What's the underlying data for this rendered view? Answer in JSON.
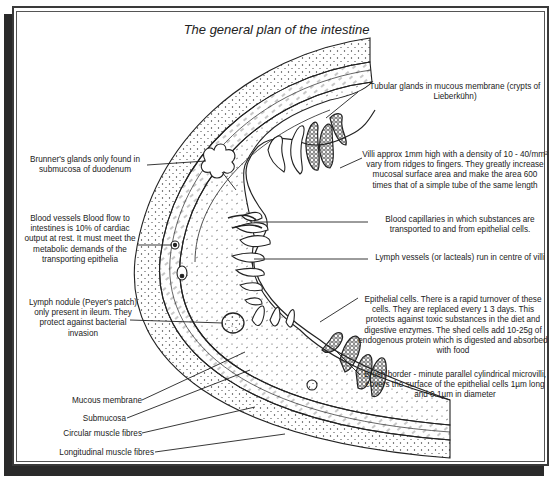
{
  "title": "The general plan of the intestine",
  "labels": {
    "tubular_glands": "Tubular glands in mucous membrane (crypts of Lieberkühn)",
    "villi": "Villi  approx 1mm high with a density of 10 - 40/mm² vary from ridges to fingers. They greatly increase mucosal surface area and make the area 600 times that of a simple tube of the same length",
    "brunners_glands": "Brunner's glands only found in submucosa of duodenum",
    "blood_vessels": "Blood vessels Blood flow to intestines is 10% of cardiac output at rest. It must meet the metabolic demands of the transporting epithelia",
    "blood_capillaries": "Blood capillaries in which substances are transported to and from epithelial cells.",
    "lymph_vessels": "Lymph vessels (or lacteals) run in centre of villi",
    "lymph_nodule": "Lymph nodule (Peyer's patch) only present in ileum. They protect against bacterial invasion",
    "epithelial_cells": "Epithelial cells. There is a rapid turnover of these cells. They are replaced every 1 3 days. This protects against toxic substances in the diet and digestive enzymes. The shed cells add 10-25g of endogenous protein which is digested and absorbed with food",
    "brush_border": "Brush border - minute parallel cylindrical microvilli, covers the surface of the epithelial cells  1µm long and 0.1µm in diameter",
    "mucous_membrane": "Mucous membrane",
    "submucosa": "Submucosa",
    "circular_muscle": "Circular muscle fibres",
    "longitudinal_muscle": "Longitudinal muscle fibres"
  },
  "colors": {
    "ink": "#222222",
    "frame_shadow": "#2a2a2a",
    "paper": "#ffffff"
  }
}
